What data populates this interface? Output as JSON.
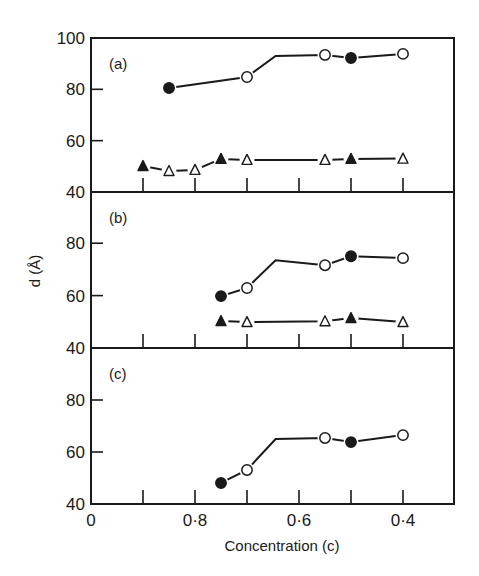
{
  "chart_data": {
    "type": "line",
    "title": "",
    "xlabel": "Concentration (c)",
    "ylabel": "d (Å)",
    "x_axis": {
      "reversed": true,
      "range": [
        1.0,
        0.3
      ],
      "ticks": [
        1.0,
        0.9,
        0.8,
        0.7,
        0.6,
        0.5,
        0.4
      ],
      "tick_labels": [
        {
          "value": 1.0,
          "label": "0"
        },
        {
          "value": 0.8,
          "label": "0·8"
        },
        {
          "value": 0.6,
          "label": "0·6"
        },
        {
          "value": 0.4,
          "label": "0·4"
        }
      ]
    },
    "grid": false,
    "legend": null,
    "panels": [
      {
        "label": "(a)",
        "ylim": [
          40,
          100
        ],
        "yticks": [
          40,
          60,
          80,
          100
        ],
        "series": [
          {
            "name": "upper",
            "line": [
              [
                0.85,
                80.5
              ],
              [
                0.7,
                84.8
              ],
              [
                0.645,
                93.0
              ],
              [
                0.55,
                93.4
              ],
              [
                0.5,
                92.2
              ],
              [
                0.4,
                93.8
              ]
            ],
            "points": [
              {
                "x": 0.85,
                "y": 80.5,
                "marker": "filled-circle"
              },
              {
                "x": 0.7,
                "y": 84.8,
                "marker": "open-circle"
              },
              {
                "x": 0.55,
                "y": 93.4,
                "marker": "open-circle"
              },
              {
                "x": 0.5,
                "y": 92.2,
                "marker": "filled-circle"
              },
              {
                "x": 0.4,
                "y": 93.8,
                "marker": "open-circle"
              }
            ]
          },
          {
            "name": "lower",
            "line": [
              [
                0.9,
                50.1
              ],
              [
                0.85,
                48.2
              ],
              [
                0.8,
                48.6
              ],
              [
                0.75,
                52.9
              ],
              [
                0.7,
                52.5
              ],
              [
                0.55,
                52.5
              ],
              [
                0.5,
                52.9
              ],
              [
                0.4,
                53.0
              ]
            ],
            "points": [
              {
                "x": 0.9,
                "y": 50.1,
                "marker": "filled-triangle"
              },
              {
                "x": 0.85,
                "y": 48.2,
                "marker": "open-triangle"
              },
              {
                "x": 0.8,
                "y": 48.6,
                "marker": "open-triangle"
              },
              {
                "x": 0.75,
                "y": 52.9,
                "marker": "filled-triangle"
              },
              {
                "x": 0.7,
                "y": 52.5,
                "marker": "open-triangle"
              },
              {
                "x": 0.55,
                "y": 52.5,
                "marker": "open-triangle"
              },
              {
                "x": 0.5,
                "y": 52.9,
                "marker": "filled-triangle"
              },
              {
                "x": 0.4,
                "y": 53.0,
                "marker": "open-triangle"
              }
            ]
          }
        ]
      },
      {
        "label": "(b)",
        "ylim": [
          40,
          100
        ],
        "yticks": [
          40,
          60,
          80
        ],
        "series": [
          {
            "name": "upper",
            "line": [
              [
                0.75,
                59.8
              ],
              [
                0.7,
                62.9
              ],
              [
                0.645,
                73.5
              ],
              [
                0.55,
                71.6
              ],
              [
                0.5,
                75.0
              ],
              [
                0.4,
                74.3
              ]
            ],
            "points": [
              {
                "x": 0.75,
                "y": 59.8,
                "marker": "filled-circle"
              },
              {
                "x": 0.7,
                "y": 62.9,
                "marker": "open-circle"
              },
              {
                "x": 0.55,
                "y": 71.6,
                "marker": "open-circle"
              },
              {
                "x": 0.5,
                "y": 75.0,
                "marker": "filled-circle"
              },
              {
                "x": 0.4,
                "y": 74.3,
                "marker": "open-circle"
              }
            ]
          },
          {
            "name": "lower",
            "line": [
              [
                0.75,
                50.3
              ],
              [
                0.7,
                49.9
              ],
              [
                0.55,
                50.2
              ],
              [
                0.5,
                51.4
              ],
              [
                0.4,
                49.9
              ]
            ],
            "points": [
              {
                "x": 0.75,
                "y": 50.3,
                "marker": "filled-triangle"
              },
              {
                "x": 0.7,
                "y": 49.9,
                "marker": "open-triangle"
              },
              {
                "x": 0.55,
                "y": 50.2,
                "marker": "open-triangle"
              },
              {
                "x": 0.5,
                "y": 51.4,
                "marker": "filled-triangle"
              },
              {
                "x": 0.4,
                "y": 49.9,
                "marker": "open-triangle"
              }
            ]
          }
        ]
      },
      {
        "label": "(c)",
        "ylim": [
          40,
          100
        ],
        "yticks": [
          40,
          60,
          80
        ],
        "series": [
          {
            "name": "upper",
            "line": [
              [
                0.75,
                48.1
              ],
              [
                0.7,
                53.1
              ],
              [
                0.645,
                65.0
              ],
              [
                0.55,
                65.4
              ],
              [
                0.5,
                63.8
              ],
              [
                0.4,
                66.5
              ]
            ],
            "points": [
              {
                "x": 0.75,
                "y": 48.1,
                "marker": "filled-circle"
              },
              {
                "x": 0.7,
                "y": 53.1,
                "marker": "open-circle"
              },
              {
                "x": 0.55,
                "y": 65.4,
                "marker": "open-circle"
              },
              {
                "x": 0.5,
                "y": 63.8,
                "marker": "filled-circle"
              },
              {
                "x": 0.4,
                "y": 66.5,
                "marker": "open-circle"
              }
            ]
          }
        ]
      }
    ]
  },
  "layout": {
    "plot_left": 91,
    "plot_right": 454,
    "x_at_1": 91,
    "px_per_0_1": 52,
    "panels_px": [
      {
        "top": 38,
        "bottom": 192
      },
      {
        "top": 192,
        "bottom": 348
      },
      {
        "top": 348,
        "bottom": 504
      }
    ],
    "px_per_unit": [
      2.567,
      2.62,
      2.6
    ]
  },
  "colors": {
    "ink": "#1a1a1a",
    "background": "#ffffff"
  }
}
